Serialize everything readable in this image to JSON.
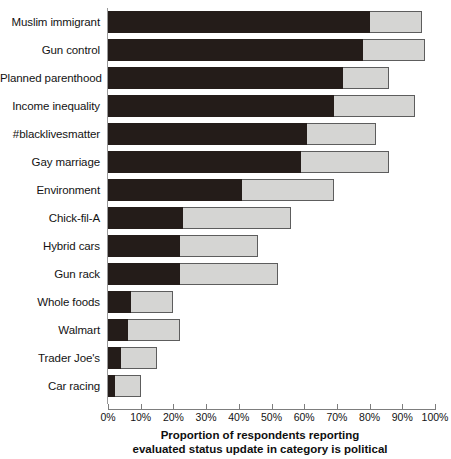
{
  "chart_data": {
    "type": "bar",
    "orientation": "horizontal",
    "stacked": true,
    "title": "",
    "xlabel": "Proportion of respondents reporting evaluated status update in category is political",
    "xlabel_line1": "Proportion of respondents reporting",
    "xlabel_line2": "evaluated status update in category is political",
    "ylabel": "",
    "xlim": [
      0,
      100
    ],
    "grid": false,
    "legend": "none",
    "xticks": [
      0,
      10,
      20,
      30,
      40,
      50,
      60,
      70,
      80,
      90,
      100
    ],
    "xtick_labels": [
      "0%",
      "10%",
      "20%",
      "30%",
      "40%",
      "50%",
      "60%",
      "70%",
      "80%",
      "90%",
      "100%"
    ],
    "categories": [
      "Muslim immigrant",
      "Gun control",
      "Planned parenthood",
      "Income inequality",
      "#blacklivesmatter",
      "Gay marriage",
      "Environment",
      "Chick-fil-A",
      "Hybrid cars",
      "Gun rack",
      "Whole foods",
      "Walmart",
      "Trader Joe's",
      "Car racing"
    ],
    "series": [
      {
        "name": "dark-segment",
        "color": "#241c19",
        "values": [
          80,
          78,
          72,
          69,
          61,
          59,
          41,
          23,
          22,
          22,
          7,
          6,
          4,
          2
        ]
      },
      {
        "name": "light-segment",
        "color": "#d5d5d3",
        "values": [
          16,
          19,
          14,
          25,
          21,
          27,
          28,
          33,
          24,
          30,
          13,
          16,
          11,
          8
        ]
      }
    ],
    "totals": [
      96,
      97,
      86,
      94,
      82,
      86,
      69,
      56,
      46,
      52,
      20,
      22,
      15,
      10
    ]
  },
  "colors": {
    "dark": "#241c19",
    "light": "#d5d5d3",
    "outline": "#5d5d5d",
    "axis": "#7d7d7d",
    "text": "#131313",
    "background": "#ffffff"
  }
}
